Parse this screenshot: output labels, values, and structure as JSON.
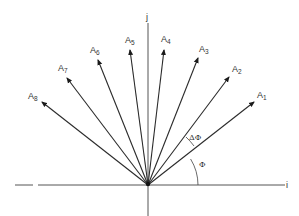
{
  "diagram": {
    "axes": {
      "horizontal_label": "i",
      "vertical_label": "j",
      "color": "#555555"
    },
    "origin": {
      "x": 148,
      "y": 185
    },
    "vectors": [
      {
        "name": "A",
        "sub": "1",
        "tip": [
          254,
          102
        ],
        "label_pos": [
          257,
          98
        ]
      },
      {
        "name": "A",
        "sub": "2",
        "tip": [
          229,
          77
        ],
        "label_pos": [
          232,
          72
        ]
      },
      {
        "name": "A",
        "sub": "3",
        "tip": [
          198,
          58
        ],
        "label_pos": [
          199,
          52
        ]
      },
      {
        "name": "A",
        "sub": "4",
        "tip": [
          164,
          50
        ],
        "label_pos": [
          161,
          42
        ]
      },
      {
        "name": "A",
        "sub": "5",
        "tip": [
          130,
          50
        ],
        "label_pos": [
          125,
          43
        ]
      },
      {
        "name": "A",
        "sub": "6",
        "tip": [
          98,
          60
        ],
        "label_pos": [
          90,
          53
        ]
      },
      {
        "name": "A",
        "sub": "7",
        "tip": [
          67,
          78
        ],
        "label_pos": [
          58,
          71
        ]
      },
      {
        "name": "A",
        "sub": "8",
        "tip": [
          42,
          102
        ],
        "label_pos": [
          28,
          99
        ]
      }
    ],
    "angles": {
      "phi_label": "Φ",
      "delta_phi_label": "ΔΦ"
    },
    "line_color": "#2a2a2a"
  }
}
